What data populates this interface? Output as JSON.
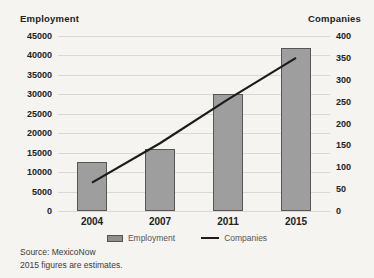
{
  "chart_data": {
    "type": "bar",
    "categories": [
      "2004",
      "2007",
      "2011",
      "2015"
    ],
    "series": [
      {
        "name": "Employment",
        "type": "bar",
        "axis": "left",
        "color": "#9e9e9e",
        "values": [
          12500,
          16000,
          30000,
          42000
        ]
      },
      {
        "name": "Companies",
        "type": "line",
        "axis": "right",
        "color": "#1c1c1c",
        "values": [
          65,
          155,
          255,
          350
        ]
      }
    ],
    "left_axis": {
      "title": "Employment",
      "min": 0,
      "max": 45000,
      "step": 5000,
      "ticks": [
        "45000",
        "40000",
        "35000",
        "30000",
        "25000",
        "20000",
        "15000",
        "10000",
        "5000",
        "0"
      ]
    },
    "right_axis": {
      "title": "Companies",
      "min": 0,
      "max": 400,
      "step": 50,
      "ticks": [
        "400",
        "350",
        "300",
        "250",
        "200",
        "150",
        "100",
        "50",
        "0"
      ]
    },
    "grid": true,
    "legend_position": "bottom"
  },
  "legend": {
    "items": [
      {
        "label": "Employment",
        "swatch": "bar"
      },
      {
        "label": "Companies",
        "swatch": "line"
      }
    ]
  },
  "footer": {
    "source": "Source: MexicoNow",
    "note": "2015 figures are estimates."
  },
  "colors": {
    "background": "#f5f4f0",
    "bar_fill": "#9e9e9e",
    "bar_border": "#565656",
    "line": "#1c1c1c",
    "grid": "#d9d8d2",
    "text": "#2a2a2a"
  }
}
